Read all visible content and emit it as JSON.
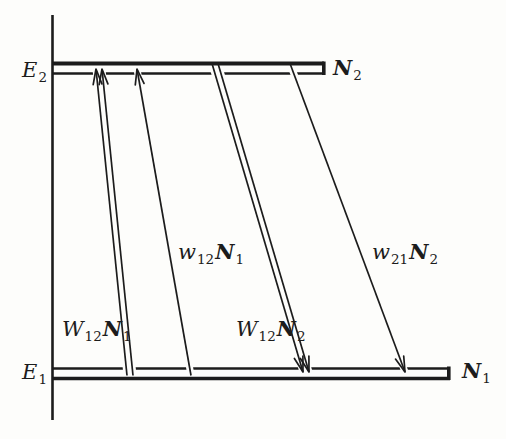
{
  "figure": {
    "colors": {
      "ink": "#1c1c1c",
      "paper": "#fdfdfb"
    },
    "levels": [
      {
        "id": "upper",
        "energy_main": "E",
        "energy_sub": "2",
        "population_main": "N",
        "population_sub": "2"
      },
      {
        "id": "lower",
        "energy_main": "E",
        "energy_sub": "1",
        "population_main": "N",
        "population_sub": "1"
      }
    ],
    "transitions": [
      {
        "id": "stimulated-absorption",
        "direction": "up",
        "style": "double-line",
        "rate_main": "W",
        "rate_sub": "12",
        "pop_main": "N",
        "pop_sub": "1"
      },
      {
        "id": "pump-absorption",
        "direction": "up",
        "style": "single-line",
        "rate_main": "w",
        "rate_sub": "12",
        "pop_main": "N",
        "pop_sub": "1"
      },
      {
        "id": "stimulated-emission",
        "direction": "down",
        "style": "double-line",
        "rate_main": "W",
        "rate_sub": "12",
        "pop_main": "N",
        "pop_sub": "2"
      },
      {
        "id": "spontaneous-decay",
        "direction": "down",
        "style": "single-line",
        "rate_main": "w",
        "rate_sub": "21",
        "pop_main": "N",
        "pop_sub": "2"
      }
    ]
  }
}
